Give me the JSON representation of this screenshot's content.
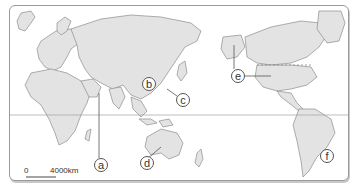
{
  "map": {
    "projection": "Pacific-centered world map",
    "land_color": "#e3e3e3",
    "border_color": "#8c8c8c",
    "ocean_color": "#ffffff",
    "equator_line": true,
    "labels": [
      {
        "id": "a",
        "text": "a",
        "region": "Arabian Peninsula / Middle East",
        "x": 94,
        "y": 164
      },
      {
        "id": "b",
        "text": "b",
        "region": "China",
        "x": 141,
        "y": 83
      },
      {
        "id": "c",
        "text": "c",
        "region": "East China Sea / Pacific",
        "x": 176,
        "y": 97
      },
      {
        "id": "d",
        "text": "d",
        "region": "Australia",
        "x": 140,
        "y": 161
      },
      {
        "id": "e",
        "text": "e",
        "region": "Alaska / United States",
        "x": 231,
        "y": 75
      },
      {
        "id": "f",
        "text": "f",
        "region": "Brazil",
        "x": 320,
        "y": 154
      }
    ],
    "scale_bar": {
      "start": "0",
      "end": "4000km"
    }
  }
}
